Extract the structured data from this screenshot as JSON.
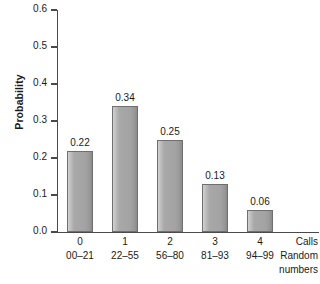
{
  "chart_data": {
    "type": "bar",
    "title": "",
    "xlabel": "",
    "ylabel": "Probability",
    "ylim": [
      0.0,
      0.6
    ],
    "ytick_labels": [
      "0.0",
      "0.1",
      "0.2",
      "0.3",
      "0.4",
      "0.5",
      "0.6"
    ],
    "ytick_values": [
      0.0,
      0.1,
      0.2,
      0.3,
      0.4,
      0.5,
      0.6
    ],
    "grid": false,
    "legend": "none",
    "categories": [
      "0",
      "1",
      "2",
      "3",
      "4"
    ],
    "category_ranges": [
      "00–21",
      "22–55",
      "56–80",
      "81–93",
      "94–99"
    ],
    "values": [
      0.22,
      0.34,
      0.25,
      0.13,
      0.06
    ],
    "value_labels": [
      "0.22",
      "0.34",
      "0.25",
      "0.13",
      "0.06"
    ],
    "row_captions": [
      "Calls",
      "Random",
      "numbers"
    ],
    "colors": {
      "bar_fill": "#a8a8a8",
      "bar_edge": "#6f6f6f",
      "axis": "#4a4a4a",
      "text": "#1a1a1a",
      "background": "#ffffff"
    }
  }
}
